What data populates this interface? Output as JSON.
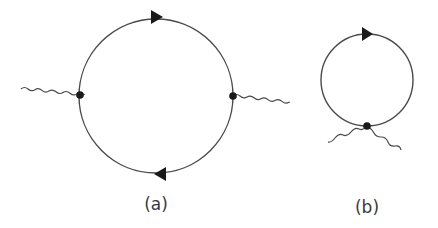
{
  "diagram": {
    "type": "feynman-diagrams",
    "colors": {
      "line": "#4a4a4a",
      "vertex": "#1a1a1a",
      "arrow": "#1a1a1a",
      "label": "#3a3a3a"
    },
    "panels": [
      {
        "id": "a",
        "label": "(a)",
        "loop": {
          "cx": 156,
          "cy": 96,
          "r": 77
        },
        "arrows": [
          {
            "position": "top",
            "direction": "right"
          },
          {
            "position": "bottom",
            "direction": "left"
          }
        ],
        "vertices": [
          {
            "x": 80,
            "y": 95
          },
          {
            "x": 233,
            "y": 96
          }
        ],
        "external_lines": [
          {
            "style": "wavy",
            "from": [
              21,
              89
            ],
            "to": [
              80,
              95
            ]
          },
          {
            "style": "wavy",
            "from": [
              233,
              96
            ],
            "to": [
              289,
              103
            ]
          }
        ]
      },
      {
        "id": "b",
        "label": "(b)",
        "loop": {
          "cx": 367,
          "cy": 80,
          "r": 46
        },
        "arrows": [
          {
            "position": "top",
            "direction": "right"
          }
        ],
        "vertices": [
          {
            "x": 367,
            "y": 126
          }
        ],
        "external_lines": [
          {
            "style": "wavy",
            "from": [
              367,
              126
            ],
            "to": [
              328,
              142
            ]
          },
          {
            "style": "wavy",
            "from": [
              367,
              126
            ],
            "to": [
              401,
              150
            ]
          }
        ]
      }
    ]
  }
}
